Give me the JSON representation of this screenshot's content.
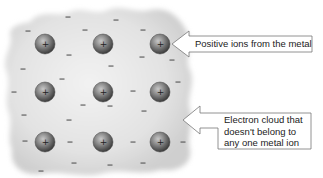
{
  "diagram": {
    "colors": {
      "background": "#ffffff",
      "cloud": "#d9d9d9",
      "cloud_light": "#efefef",
      "ion_dark": "#4a4a4a",
      "ion_light": "#b8b8b8",
      "electron": "#555555",
      "arrow_stroke": "#777777",
      "text": "#222222"
    },
    "ions": {
      "symbol": "+",
      "rows": 3,
      "cols": 3,
      "positions": [
        [
          45,
          44
        ],
        [
          103,
          44
        ],
        [
          160,
          44
        ],
        [
          45,
          92
        ],
        [
          103,
          92
        ],
        [
          160,
          92
        ],
        [
          45,
          142
        ],
        [
          103,
          142
        ],
        [
          160,
          142
        ]
      ]
    },
    "electrons": {
      "symbol": "−",
      "positions": [
        [
          68,
          17
        ],
        [
          116,
          20
        ],
        [
          28,
          31
        ],
        [
          85,
          30
        ],
        [
          143,
          30
        ],
        [
          69,
          55
        ],
        [
          142,
          57
        ],
        [
          172,
          60
        ],
        [
          23,
          69
        ],
        [
          111,
          66
        ],
        [
          62,
          79
        ],
        [
          178,
          82
        ],
        [
          14,
          92
        ],
        [
          133,
          91
        ],
        [
          83,
          105
        ],
        [
          24,
          115
        ],
        [
          144,
          111
        ],
        [
          69,
          120
        ],
        [
          110,
          106
        ],
        [
          25,
          141
        ],
        [
          70,
          142
        ],
        [
          133,
          142
        ],
        [
          183,
          142
        ],
        [
          74,
          163
        ],
        [
          110,
          165
        ],
        [
          143,
          163
        ],
        [
          41,
          171
        ]
      ]
    },
    "callouts": [
      {
        "id": "ions",
        "label": "Positive ions from the metal"
      },
      {
        "id": "cloud",
        "lines": [
          "Electron cloud that",
          "doesn't belong to",
          "any one metal ion"
        ]
      }
    ]
  }
}
